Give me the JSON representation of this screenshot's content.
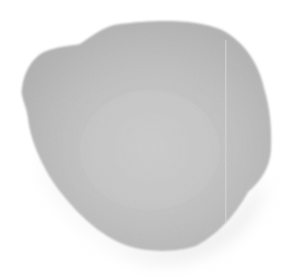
{
  "image": {
    "subject": "gray irregular blob",
    "description": "A single soft-edged, irregular gray rounded shape on a white background",
    "width": 297,
    "height": 277
  },
  "colors": {
    "background": "#ffffff",
    "blob_center": "#c9c9c9",
    "blob_mid": "#bfbfbf",
    "blob_edge": "#b2b2b2",
    "shadow": "#d8d8d8",
    "streak": "#d2d2d2"
  }
}
